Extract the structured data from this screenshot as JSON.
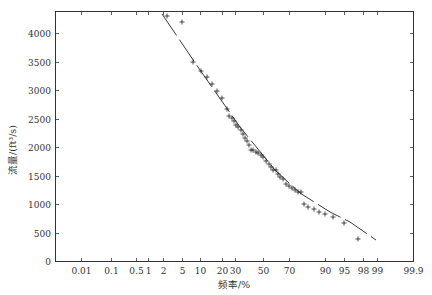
{
  "chart_data": {
    "type": "scatter",
    "title": "",
    "xlabel": "频率/%",
    "ylabel": "流量/(ft³/s)",
    "x_scale": "normal-probability",
    "xlim": [
      0.001,
      99.9
    ],
    "ylim": [
      0,
      4400
    ],
    "grid": false,
    "legend": null,
    "x_ticks": [
      {
        "label": "0.01",
        "value": 0.01,
        "px": 81
      },
      {
        "label": "0.1",
        "value": 0.1,
        "px": 111
      },
      {
        "label": "0.5",
        "value": 0.5,
        "px": 136
      },
      {
        "label": "1",
        "value": 1,
        "px": 148
      },
      {
        "label": "2",
        "value": 2,
        "px": 163
      },
      {
        "label": "5",
        "value": 5,
        "px": 182
      },
      {
        "label": "10",
        "value": 10,
        "px": 200
      },
      {
        "label": "20",
        "value": 20,
        "px": 222
      },
      {
        "label": "30",
        "value": 30,
        "px": 235
      },
      {
        "label": "50",
        "value": 50,
        "px": 263
      },
      {
        "label": "70",
        "value": 70,
        "px": 289
      },
      {
        "label": "90",
        "value": 90,
        "px": 325
      },
      {
        "label": "95",
        "value": 95,
        "px": 344
      },
      {
        "label": "98",
        "value": 98,
        "px": 363
      },
      {
        "label": "99",
        "value": 99,
        "px": 377
      },
      {
        "label": "99.9",
        "value": 99.9,
        "px": 413
      }
    ],
    "y_ticks": [
      0,
      500,
      1000,
      1500,
      2000,
      2500,
      3000,
      3500,
      4000
    ],
    "series": [
      {
        "name": "observed",
        "marker": "+",
        "points_px": [
          [
            167,
            16
          ],
          [
            182,
            22
          ],
          [
            193,
            62
          ],
          [
            201,
            71
          ],
          [
            207,
            77
          ],
          [
            212,
            84
          ],
          [
            217,
            91
          ],
          [
            222,
            98
          ],
          [
            227,
            109
          ],
          [
            229,
            116
          ],
          [
            232,
            118
          ],
          [
            234,
            121
          ],
          [
            236,
            125
          ],
          [
            238,
            127
          ],
          [
            241,
            130
          ],
          [
            243,
            134
          ],
          [
            245,
            138
          ],
          [
            247,
            141
          ],
          [
            249,
            145
          ],
          [
            251,
            150
          ],
          [
            253,
            150
          ],
          [
            256,
            152
          ],
          [
            258,
            153
          ],
          [
            261,
            155
          ],
          [
            263,
            157
          ],
          [
            266,
            161
          ],
          [
            269,
            164
          ],
          [
            271,
            167
          ],
          [
            273,
            170
          ],
          [
            276,
            170
          ],
          [
            278,
            174
          ],
          [
            280,
            177
          ],
          [
            283,
            179
          ],
          [
            286,
            184
          ],
          [
            289,
            186
          ],
          [
            292,
            188
          ],
          [
            295,
            190
          ],
          [
            298,
            192
          ],
          [
            301,
            192
          ],
          [
            304,
            204
          ],
          [
            308,
            207
          ],
          [
            314,
            209
          ],
          [
            319,
            212
          ],
          [
            325,
            214
          ],
          [
            333,
            217
          ],
          [
            344,
            223
          ],
          [
            358,
            239
          ]
        ],
        "approx_values": [
          {
            "freq_pct": 2,
            "flow": 4280
          },
          {
            "freq_pct": 5,
            "flow": 4200
          },
          {
            "freq_pct": 8,
            "flow": 3500
          },
          {
            "freq_pct": 10,
            "flow": 3350
          },
          {
            "freq_pct": 13,
            "flow": 3250
          },
          {
            "freq_pct": 16,
            "flow": 3120
          },
          {
            "freq_pct": 20,
            "flow": 3000
          },
          {
            "freq_pct": 23,
            "flow": 2780
          },
          {
            "freq_pct": 26,
            "flow": 2530
          },
          {
            "freq_pct": 30,
            "flow": 2440
          },
          {
            "freq_pct": 35,
            "flow": 2300
          },
          {
            "freq_pct": 40,
            "flow": 2170
          },
          {
            "freq_pct": 45,
            "flow": 1990
          },
          {
            "freq_pct": 50,
            "flow": 1900
          },
          {
            "freq_pct": 55,
            "flow": 1800
          },
          {
            "freq_pct": 60,
            "flow": 1700
          },
          {
            "freq_pct": 65,
            "flow": 1600
          },
          {
            "freq_pct": 70,
            "flow": 1480
          },
          {
            "freq_pct": 75,
            "flow": 1380
          },
          {
            "freq_pct": 80,
            "flow": 1300
          },
          {
            "freq_pct": 83,
            "flow": 1000
          },
          {
            "freq_pct": 86,
            "flow": 920
          },
          {
            "freq_pct": 88,
            "flow": 880
          },
          {
            "freq_pct": 90,
            "flow": 820
          },
          {
            "freq_pct": 92,
            "flow": 760
          },
          {
            "freq_pct": 95,
            "flow": 650
          },
          {
            "freq_pct": 97.5,
            "flow": 380
          }
        ]
      },
      {
        "name": "fitted-curve",
        "style": "long-dashed line",
        "points_px": [
          [
            162,
            14
          ],
          [
            200,
            70
          ],
          [
            240,
            127
          ],
          [
            275,
            170
          ],
          [
            300,
            193
          ],
          [
            330,
            212
          ],
          [
            350,
            222
          ],
          [
            376,
            240
          ]
        ],
        "approx_values": [
          {
            "freq_pct": 2,
            "flow": 4330
          },
          {
            "freq_pct": 10,
            "flow": 3350
          },
          {
            "freq_pct": 30,
            "flow": 2350
          },
          {
            "freq_pct": 60,
            "flow": 1600
          },
          {
            "freq_pct": 80,
            "flow": 1200
          },
          {
            "freq_pct": 92,
            "flow": 860
          },
          {
            "freq_pct": 96,
            "flow": 680
          },
          {
            "freq_pct": 99,
            "flow": 370
          }
        ]
      }
    ],
    "plot_px": {
      "left": 55,
      "right": 413,
      "top": 11,
      "bottom": 261,
      "y_per_unit": 0.057
    }
  }
}
